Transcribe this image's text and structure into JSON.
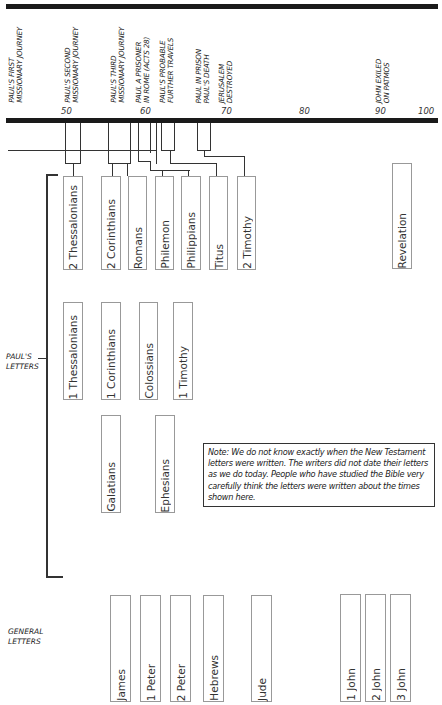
{
  "timeline": {
    "events": [
      {
        "label": "Paul's First\nMissionary Journey"
      },
      {
        "label": "Paul's Second\nMissionary Journey"
      },
      {
        "label": "Paul's Third\nMissionary Journey"
      },
      {
        "label": "Paul a Prisoner\nin Rome (Acts 28)"
      },
      {
        "label": "Paul's Probable\nFurther Travels"
      },
      {
        "label": "Paul in Prison\nPaul's Death"
      },
      {
        "label": "Jerusalem\nDestroyed"
      },
      {
        "label": "John Exiled\non Patmos"
      }
    ],
    "years": [
      "50",
      "60",
      "70",
      "80",
      "90",
      "100"
    ]
  },
  "sections": {
    "pauls_letters": "Paul's\nLetters",
    "general_letters": "General\nLetters"
  },
  "pauls_letters": {
    "row1": [
      "2 Thessalonians",
      "2 Corinthians",
      "Romans",
      "Philemon",
      "Philippians",
      "Titus",
      "2 Timothy",
      "Revelation"
    ],
    "row2": [
      "1 Thessalonians",
      "1 Corinthians",
      "Colossians",
      "1 Timothy"
    ],
    "row3": [
      "Galatians",
      "Ephesians"
    ]
  },
  "general_letters": [
    "James",
    "1 Peter",
    "2 Peter",
    "Hebrews",
    "Jude",
    "1 John",
    "2 John",
    "3 John"
  ],
  "note": "Note: We do not know exactly when the New Testament letters were written. The writers did not date their letters as we do today. People who have studied the Bible very carefully think the letters were written about the times shown here."
}
